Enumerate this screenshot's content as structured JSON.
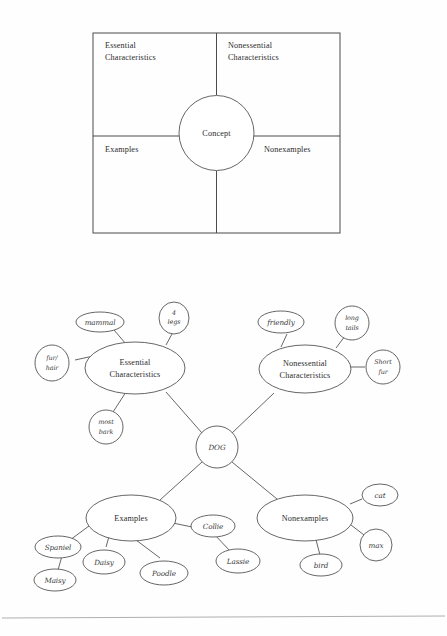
{
  "page": {
    "background_color": "#fefefe",
    "ink_color": "#4a4a4a"
  },
  "top_figure": {
    "name": "concept-definition-map-template",
    "center_label": "Concept",
    "quadrants": {
      "top_left_line1": "Essential",
      "top_left_line2": "Characteristics",
      "top_right_line1": "Nonessential",
      "top_right_line2": "Characteristics",
      "bottom_left": "Examples",
      "bottom_right": "Nonexamples"
    }
  },
  "bottom_figure": {
    "name": "completed-concept-map-dog",
    "center_label": "DOG",
    "branches": [
      {
        "id": "essential",
        "label_line1": "Essential",
        "label_line2": "Characteristics",
        "children": [
          "mammal",
          "4 legs",
          "fur/ hair",
          "most bark"
        ]
      },
      {
        "id": "nonessential",
        "label_line1": "Nonessential",
        "label_line2": "Characteristics",
        "children": [
          "friendly",
          "long tails",
          "short fur"
        ]
      },
      {
        "id": "examples",
        "label_line1": "Examples",
        "label_line2": "",
        "children": [
          "Spaniel",
          "Daisy",
          "Poodle",
          "Collie",
          "Lassie",
          "Maisy"
        ]
      },
      {
        "id": "nonexamples",
        "label_line1": "Nonexamples",
        "label_line2": "",
        "children": [
          "cat",
          "max",
          "bird"
        ]
      }
    ],
    "leaves": {
      "mammal": "mammal",
      "four_legs_line1": "4",
      "four_legs_line2": "legs",
      "fur_hair_line1": "fur/",
      "fur_hair_line2": "hair",
      "most_bark_line1": "most",
      "most_bark_line2": "bark",
      "friendly": "friendly",
      "long_tails_line1": "long",
      "long_tails_line2": "tails",
      "short_fur_line1": "Short",
      "short_fur_line2": "fur",
      "spaniel": "Spaniel",
      "maisy": "Maisy",
      "daisy": "Daisy",
      "poodle": "Poodle",
      "collie": "Collie",
      "lassie": "Lassie",
      "cat": "cat",
      "max": "max",
      "bird": "bird"
    }
  }
}
